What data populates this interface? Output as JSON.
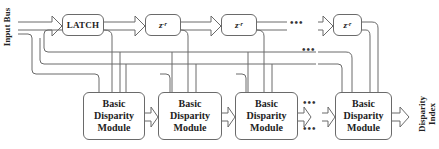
{
  "diagram": {
    "input_label": "Input Bus",
    "output_label_line1": "Disparity",
    "output_label_line2": "Index",
    "latch": {
      "label": "LATCH"
    },
    "delays": [
      {
        "base": "z",
        "exp": "-r"
      },
      {
        "base": "z",
        "exp": "-r"
      },
      {
        "base": "z",
        "exp": "-r"
      }
    ],
    "modules": [
      {
        "line1": "Basic",
        "line2": "Disparity",
        "line3": "Module"
      },
      {
        "line1": "Basic",
        "line2": "Disparity",
        "line3": "Module"
      },
      {
        "line1": "Basic",
        "line2": "Disparity",
        "line3": "Module"
      },
      {
        "line1": "Basic",
        "line2": "Disparity",
        "line3": "Module"
      }
    ],
    "ellipsis": "•••",
    "colors": {
      "line": "#6a6a6a",
      "text": "#222222",
      "background": "#ffffff"
    }
  }
}
